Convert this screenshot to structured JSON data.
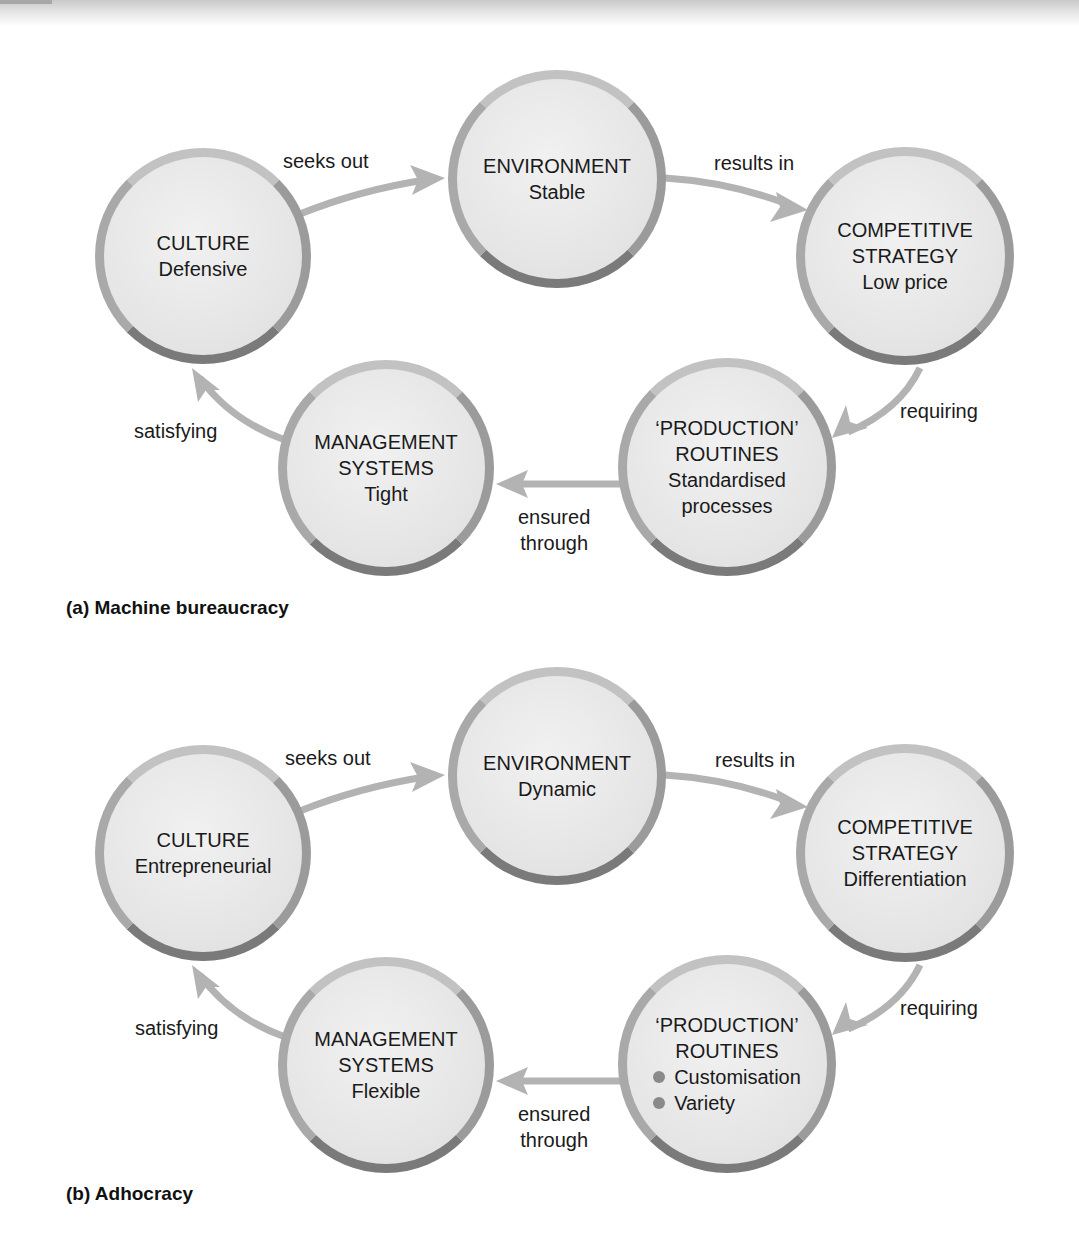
{
  "diagrams": [
    {
      "caption": "(a) Machine bureaucracy",
      "nodes": {
        "culture": {
          "title": "CULTURE",
          "value": "Defensive"
        },
        "environment": {
          "title": "ENVIRONMENT",
          "value": "Stable"
        },
        "strategy": {
          "title_1": "COMPETITIVE",
          "title_2": "STRATEGY",
          "value": "Low price"
        },
        "routines": {
          "title_1": "‘PRODUCTION’",
          "title_2": "ROUTINES",
          "value_1": "Standardised",
          "value_2": "processes"
        },
        "management": {
          "title_1": "MANAGEMENT",
          "title_2": "SYSTEMS",
          "value": "Tight"
        }
      },
      "links": {
        "culture_to_environment": "seeks out",
        "environment_to_strategy": "results in",
        "strategy_to_routines": "requiring",
        "routines_to_management_1": "ensured",
        "routines_to_management_2": "through",
        "management_to_culture": "satisfying"
      }
    },
    {
      "caption": "(b) Adhocracy",
      "nodes": {
        "culture": {
          "title": "CULTURE",
          "value": "Entrepreneurial"
        },
        "environment": {
          "title": "ENVIRONMENT",
          "value": "Dynamic"
        },
        "strategy": {
          "title_1": "COMPETITIVE",
          "title_2": "STRATEGY",
          "value": "Differentiation"
        },
        "routines": {
          "title_1": "‘PRODUCTION’",
          "title_2": "ROUTINES",
          "bullets": [
            "Customisation",
            "Variety"
          ]
        },
        "management": {
          "title_1": "MANAGEMENT",
          "title_2": "SYSTEMS",
          "value": "Flexible"
        }
      },
      "links": {
        "culture_to_environment": "seeks out",
        "environment_to_strategy": "results in",
        "strategy_to_routines": "requiring",
        "routines_to_management_1": "ensured",
        "routines_to_management_2": "through",
        "management_to_culture": "satisfying"
      }
    }
  ],
  "colors": {
    "arrow": "#b3b3b3",
    "ring": "#8e8e8e",
    "fill": "#e6e6e6",
    "text": "#1a1a1a"
  }
}
